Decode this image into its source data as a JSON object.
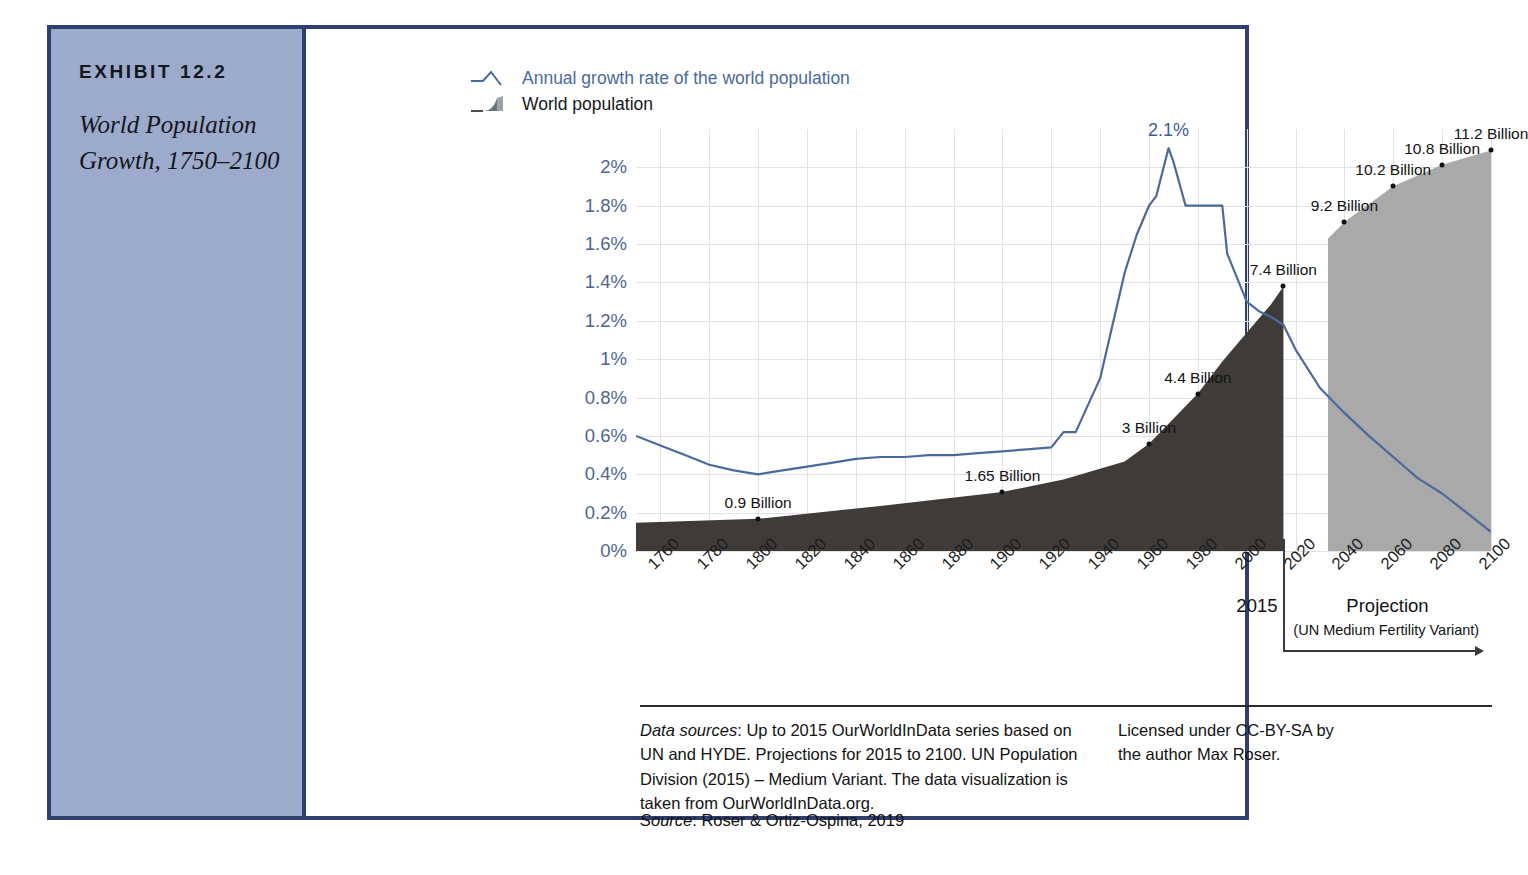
{
  "exhibit": {
    "label": "EXHIBIT 12.2",
    "title": "World Population Growth, 1750–2100"
  },
  "legend": {
    "line_label": "Annual growth rate of the world population",
    "area_label": "World population",
    "line_color": "#4a6a9c",
    "area_color": "#3f3b38",
    "projection_color": "#a9a9a9"
  },
  "projection": {
    "boundary_year_label": "2015",
    "word": "Projection",
    "subtitle": "(UN Medium Fertility Variant)"
  },
  "footer": {
    "data_sources_label": "Data sources",
    "data_sources_text": ": Up to 2015 OurWorldInData series based on UN and HYDE. Projections for 2015 to 2100. UN Population Division (2015) – Medium Variant. The data visualization is taken from OurWorldInData.org.",
    "license_text": "Licensed under CC-BY-SA by the author Max Roser.",
    "source_label": "Source",
    "source_text": ": Roser & Ortiz-Ospina, 2019"
  },
  "chart_data": {
    "type": "line",
    "title": "World Population Growth, 1750–2100",
    "xlabel": "",
    "ylabel": "",
    "xlim": [
      1750,
      2100
    ],
    "ylim": [
      0,
      2.2
    ],
    "grid": true,
    "legend_position": "top-left",
    "ytick_labels": [
      "0%",
      "0.2%",
      "0.4%",
      "0.6%",
      "0.8%",
      "1%",
      "1.2%",
      "1.4%",
      "1.6%",
      "1.8%",
      "2%"
    ],
    "ytick_values": [
      0,
      0.2,
      0.4,
      0.6,
      0.8,
      1.0,
      1.2,
      1.4,
      1.6,
      1.8,
      2.0
    ],
    "xtick_labels": [
      "1760",
      "1780",
      "1800",
      "1820",
      "1840",
      "1860",
      "1880",
      "1900",
      "1920",
      "1940",
      "1960",
      "1980",
      "2000",
      "2020",
      "2040",
      "2060",
      "2080",
      "2100"
    ],
    "xtick_values": [
      1760,
      1780,
      1800,
      1820,
      1840,
      1860,
      1880,
      1900,
      1920,
      1940,
      1960,
      1980,
      2000,
      2020,
      2040,
      2060,
      2080,
      2100
    ],
    "series": [
      {
        "name": "Annual growth rate of the world population",
        "unit": "%",
        "type": "line",
        "color": "#4a6a9c",
        "x": [
          1750,
          1760,
          1770,
          1780,
          1790,
          1800,
          1810,
          1820,
          1830,
          1840,
          1850,
          1860,
          1870,
          1880,
          1890,
          1900,
          1910,
          1920,
          1925,
          1930,
          1940,
          1950,
          1955,
          1960,
          1963,
          1968,
          1970,
          1975,
          1980,
          1985,
          1990,
          1992,
          2000,
          2005,
          2010,
          2015,
          2020,
          2030,
          2040,
          2050,
          2060,
          2070,
          2080,
          2090,
          2100
        ],
        "y": [
          0.6,
          0.55,
          0.5,
          0.45,
          0.42,
          0.4,
          0.42,
          0.44,
          0.46,
          0.48,
          0.49,
          0.49,
          0.5,
          0.5,
          0.51,
          0.52,
          0.53,
          0.54,
          0.62,
          0.62,
          0.9,
          1.45,
          1.65,
          1.8,
          1.85,
          2.1,
          2.03,
          1.8,
          1.8,
          1.8,
          1.8,
          1.55,
          1.3,
          1.25,
          1.22,
          1.18,
          1.05,
          0.85,
          0.72,
          0.6,
          0.49,
          0.38,
          0.3,
          0.2,
          0.1
        ]
      },
      {
        "name": "World population (historical)",
        "unit": "billion",
        "type": "area",
        "color": "#3f3b38",
        "x": [
          1750,
          1800,
          1850,
          1900,
          1925,
          1950,
          1960,
          1970,
          1980,
          1990,
          2000,
          2010,
          2015
        ],
        "y": [
          0.79,
          0.9,
          1.26,
          1.65,
          2.0,
          2.5,
          3.0,
          3.7,
          4.4,
          5.3,
          6.1,
          6.9,
          7.4
        ]
      },
      {
        "name": "World population (projection)",
        "unit": "billion",
        "type": "area",
        "color": "#a9a9a9",
        "x": [
          2015,
          2030,
          2040,
          2050,
          2060,
          2070,
          2080,
          2090,
          2100
        ],
        "y": [
          7.4,
          8.5,
          9.2,
          9.7,
          10.2,
          10.5,
          10.8,
          11.0,
          11.2
        ]
      }
    ],
    "annotations": [
      {
        "text": "0.9 Billion",
        "x": 1800,
        "y_billion": 0.9,
        "series": "population"
      },
      {
        "text": "1.65 Billion",
        "x": 1900,
        "y_billion": 1.65,
        "series": "population"
      },
      {
        "text": "3 Billion",
        "x": 1960,
        "y_billion": 3.0,
        "series": "population"
      },
      {
        "text": "4.4 Billion",
        "x": 1980,
        "y_billion": 4.4,
        "series": "population"
      },
      {
        "text": "7.4 Billion",
        "x": 2015,
        "y_billion": 7.4,
        "series": "population"
      },
      {
        "text": "9.2 Billion",
        "x": 2040,
        "y_billion": 9.2,
        "series": "population"
      },
      {
        "text": "10.2 Billion",
        "x": 2060,
        "y_billion": 10.2,
        "series": "population"
      },
      {
        "text": "10.8 Billion",
        "x": 2080,
        "y_billion": 10.8,
        "series": "population"
      },
      {
        "text": "11.2 Billion",
        "x": 2100,
        "y_billion": 11.2,
        "series": "population"
      },
      {
        "text": "2.1%",
        "x": 1968,
        "y_percent": 2.1,
        "series": "growth-rate"
      }
    ]
  }
}
